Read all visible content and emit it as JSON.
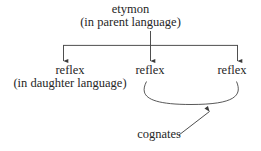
{
  "diagram": {
    "background_color": "#ffffff",
    "stroke_color": "#3b3b3b",
    "text_color": "#262626",
    "nodes": {
      "etymon": "etymon",
      "parent_language": "(in parent language)",
      "reflex_left": "reflex",
      "daughter_language": "(in daughter language)",
      "reflex_middle": "reflex",
      "reflex_right": "reflex",
      "cognates": "cognates"
    },
    "connectors": {
      "trunk": "vertical line from etymon down to distribution bar",
      "bar": "horizontal distribution bar",
      "branch_left": "arrow down to left reflex",
      "branch_middle": "arrow down to middle reflex",
      "branch_right": "arrow down to right reflex",
      "cognate_arc": "curved arc joining middle and right reflex",
      "cognate_arrow": "diagonal arrow from cognates label up to the arc"
    }
  }
}
